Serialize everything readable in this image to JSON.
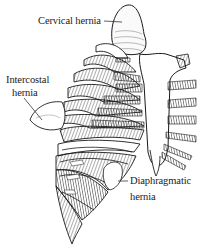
{
  "figure": {
    "labels": {
      "cervical": "Cervical hernia",
      "intercostal_line1": "Intercostal",
      "intercostal_line2": "hernia",
      "diaphragmatic_line1": "Diaphragmatic",
      "diaphragmatic_line2": "hernia"
    },
    "colors": {
      "background": "#ffffff",
      "ink": "#1a1a1a",
      "shade": "#555555"
    }
  }
}
